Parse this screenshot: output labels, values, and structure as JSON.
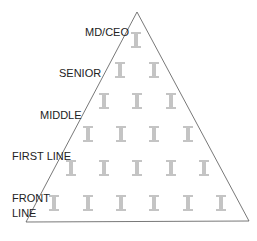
{
  "diagram": {
    "type": "hierarchy-pyramid",
    "levels": [
      {
        "label": "MD/CEO",
        "count": 1
      },
      {
        "label": "SENIOR",
        "count": 2
      },
      {
        "label": "MIDDLE",
        "count": 3
      },
      {
        "label": "FIRST LINE",
        "count": 4
      },
      {
        "label": "FIRST LINE_row2",
        "count": 5
      },
      {
        "label": "FRONT LINE",
        "count": 6
      }
    ],
    "labels": {
      "md_ceo": "MD/CEO",
      "senior": "SENIOR",
      "middle": "MIDDLE",
      "first_line": "FIRST LINE",
      "front_line_1": "FRONT",
      "front_line_2": "LINE"
    },
    "figure_icon": "person-icon",
    "colors": {
      "outline": "#555555",
      "figure": "#bdbdbd",
      "label": "#222222"
    }
  }
}
